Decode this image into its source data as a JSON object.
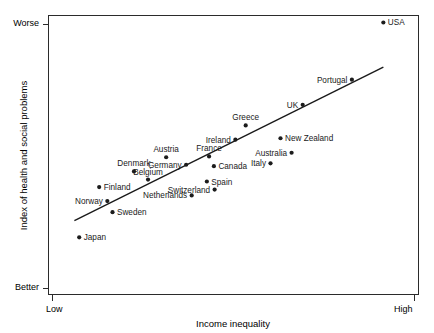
{
  "chart_data": {
    "type": "scatter",
    "title": "",
    "xlabel": "Income inequality",
    "ylabel": "Index of health and social problems",
    "xtick_labels": [
      "Low",
      "High"
    ],
    "ytick_labels": [
      "Better",
      "Worse"
    ],
    "x_axis_direction": "Low to High",
    "y_axis_direction": "Better (bottom) to Worse (top)",
    "grid": false,
    "legend": "none",
    "xlim": [
      0,
      100
    ],
    "ylim": [
      0,
      100
    ],
    "trendline": {
      "present": true,
      "x_start": 7,
      "y_start": 26.5,
      "x_end": 90.5,
      "y_end": 81.5
    },
    "points": [
      {
        "label": "USA",
        "x": 90.5,
        "y": 97.5,
        "label_pos": "right"
      },
      {
        "label": "Portugal",
        "x": 82.0,
        "y": 77.0,
        "label_pos": "left"
      },
      {
        "label": "UK",
        "x": 68.7,
        "y": 68.0,
        "label_pos": "left"
      },
      {
        "label": "Greece",
        "x": 53.3,
        "y": 60.6,
        "label_pos": "above"
      },
      {
        "label": "Ireland",
        "x": 50.5,
        "y": 55.5,
        "label_pos": "left"
      },
      {
        "label": "New Zealand",
        "x": 62.7,
        "y": 56.0,
        "label_pos": "right"
      },
      {
        "label": "Australia",
        "x": 65.7,
        "y": 50.8,
        "label_pos": "left"
      },
      {
        "label": "France",
        "x": 43.4,
        "y": 49.5,
        "label_pos": "above"
      },
      {
        "label": "Austria",
        "x": 31.8,
        "y": 49.2,
        "label_pos": "above"
      },
      {
        "label": "Canada",
        "x": 44.7,
        "y": 46.0,
        "label_pos": "right"
      },
      {
        "label": "Italy",
        "x": 60.0,
        "y": 47.0,
        "label_pos": "left"
      },
      {
        "label": "Germany",
        "x": 37.2,
        "y": 46.5,
        "label_pos": "left"
      },
      {
        "label": "Denmark",
        "x": 23.1,
        "y": 44.1,
        "label_pos": "above"
      },
      {
        "label": "Belgium",
        "x": 26.9,
        "y": 41.2,
        "label_pos": "above"
      },
      {
        "label": "Spain",
        "x": 42.8,
        "y": 40.5,
        "label_pos": "right"
      },
      {
        "label": "Finland",
        "x": 13.7,
        "y": 38.5,
        "label_pos": "right"
      },
      {
        "label": "Switzerland",
        "x": 44.9,
        "y": 37.6,
        "label_pos": "left"
      },
      {
        "label": "Netherlands",
        "x": 38.7,
        "y": 35.5,
        "label_pos": "left"
      },
      {
        "label": "Norway",
        "x": 15.9,
        "y": 33.5,
        "label_pos": "left"
      },
      {
        "label": "Sweden",
        "x": 17.3,
        "y": 29.5,
        "label_pos": "right"
      },
      {
        "label": "Japan",
        "x": 8.3,
        "y": 20.5,
        "label_pos": "right"
      }
    ]
  }
}
